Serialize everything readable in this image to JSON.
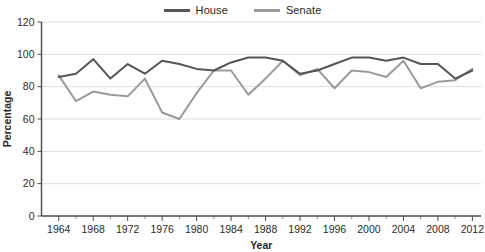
{
  "chart_data": {
    "type": "line",
    "title": "",
    "xlabel": "Year",
    "ylabel": "Percentage",
    "xlim": [
      1962,
      2013
    ],
    "ylim": [
      0,
      120
    ],
    "grid": true,
    "legend_position": "top-center",
    "x_ticks": [
      1964,
      1968,
      1972,
      1976,
      1980,
      1984,
      1988,
      1992,
      1996,
      2000,
      2004,
      2008,
      2012
    ],
    "x_tick_labels": [
      "1964",
      "1968",
      "1972",
      "1976",
      "1980",
      "1984",
      "1988",
      "1992",
      "1996",
      "2000",
      "2004",
      "2008",
      "2012"
    ],
    "x_minor_ticks": [
      1966,
      1970,
      1974,
      1978,
      1982,
      1986,
      1990,
      1994,
      1998,
      2002,
      2006,
      2010
    ],
    "y_ticks": [
      0,
      20,
      40,
      60,
      80,
      100,
      120
    ],
    "y_tick_labels": [
      "0",
      "20",
      "40",
      "60",
      "80",
      "100",
      "120"
    ],
    "x": [
      1964,
      1966,
      1968,
      1970,
      1972,
      1974,
      1976,
      1978,
      1980,
      1982,
      1984,
      1986,
      1988,
      1990,
      1992,
      1994,
      1996,
      1998,
      2000,
      2002,
      2004,
      2006,
      2008,
      2010,
      2012
    ],
    "series": [
      {
        "name": "House",
        "color": "#555555",
        "values": [
          86,
          88,
          97,
          85,
          94,
          88,
          96,
          94,
          91,
          90,
          95,
          98,
          98,
          96,
          88,
          90,
          94,
          98,
          98,
          96,
          98,
          94,
          94,
          85,
          90
        ]
      },
      {
        "name": "Senate",
        "color": "#9a9a9a",
        "values": [
          87,
          71,
          77,
          75,
          74,
          85,
          64,
          60,
          76,
          90,
          90,
          75,
          85,
          96,
          87,
          91,
          79,
          90,
          89,
          86,
          96,
          79,
          83,
          84,
          91
        ]
      }
    ]
  },
  "legend": {
    "entries": [
      {
        "label": "House",
        "color": "#555555",
        "swatch_name": "legend-swatch-house"
      },
      {
        "label": "Senate",
        "color": "#9a9a9a",
        "swatch_name": "legend-swatch-senate"
      }
    ]
  }
}
